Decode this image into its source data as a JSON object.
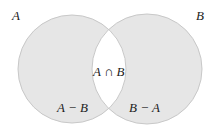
{
  "diagram": {
    "type": "venn",
    "sets": [
      {
        "name": "A",
        "label": "A"
      },
      {
        "name": "B",
        "label": "B"
      }
    ],
    "regions": {
      "a_minus_b": "A − B",
      "intersection": "A ∩ B",
      "b_minus_a": "B − A"
    },
    "colors": {
      "fill": "#e6e6e6",
      "outline": "#c8c8c8",
      "intersection": "#ffffff",
      "text": "#222222"
    }
  }
}
